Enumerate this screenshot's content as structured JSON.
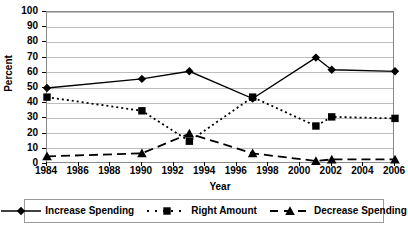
{
  "chart_data": {
    "type": "line",
    "title": "",
    "xlabel": "Year",
    "ylabel": "Percent",
    "xlim": [
      1984,
      2006
    ],
    "ylim": [
      0,
      100
    ],
    "ytick_step": 10,
    "xtick_step": 2,
    "grid": true,
    "legend_position": "bottom",
    "x": [
      1984,
      1990,
      1993,
      1997,
      2001,
      2002,
      2006
    ],
    "xticks": [
      1984,
      1986,
      1988,
      1990,
      1992,
      1994,
      1996,
      1998,
      2000,
      2002,
      2004,
      2006
    ],
    "yticks": [
      0,
      10,
      20,
      30,
      40,
      50,
      60,
      70,
      80,
      90,
      100
    ],
    "series": [
      {
        "name": "Increase Spending",
        "marker": "diamond",
        "linestyle": "solid",
        "color": "#000000",
        "values": [
          50,
          56,
          61,
          43,
          70,
          62,
          61
        ]
      },
      {
        "name": "Right Amount",
        "marker": "square",
        "linestyle": "dotted",
        "color": "#000000",
        "values": [
          44,
          35,
          15,
          44,
          25,
          31,
          30
        ]
      },
      {
        "name": "Decrease Spending",
        "marker": "triangle",
        "linestyle": "dashed",
        "color": "#000000",
        "values": [
          5,
          7,
          20,
          7,
          2,
          3,
          3
        ]
      }
    ]
  },
  "axes": {
    "y_title": "Percent",
    "x_title": "Year"
  }
}
